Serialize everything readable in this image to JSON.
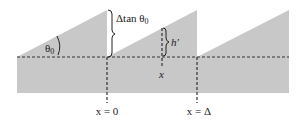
{
  "diagram": {
    "type": "sawtooth-surface-profile",
    "colors": {
      "fill": "#c8c8c8",
      "line": "#333333",
      "background": "#ffffff"
    },
    "labels": {
      "angle": "θ",
      "angle_sub": "0",
      "step_height": "Δtan θ",
      "step_height_sub": "0",
      "local_height": "h′",
      "position": "x",
      "origin": "x = 0",
      "period": "x = Δ"
    }
  }
}
